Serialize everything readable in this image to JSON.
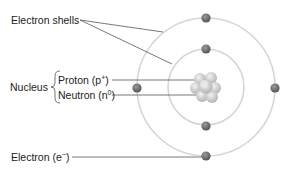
{
  "labels": {
    "electron_shells": "Electron shells",
    "nucleus": "Nucleus",
    "proton": "Proton (p",
    "proton_sup": "+",
    "proton_end": ")",
    "neutron": "Neutron (n",
    "neutron_sup": "0",
    "neutron_end": ")",
    "electron": "Electron (e",
    "electron_sup": "−",
    "electron_end": ")"
  },
  "colors": {
    "shell": "#d4d4d4",
    "electron": "#6e6e6e",
    "leader": "#555555",
    "nucleus": "#c8c8c8"
  }
}
